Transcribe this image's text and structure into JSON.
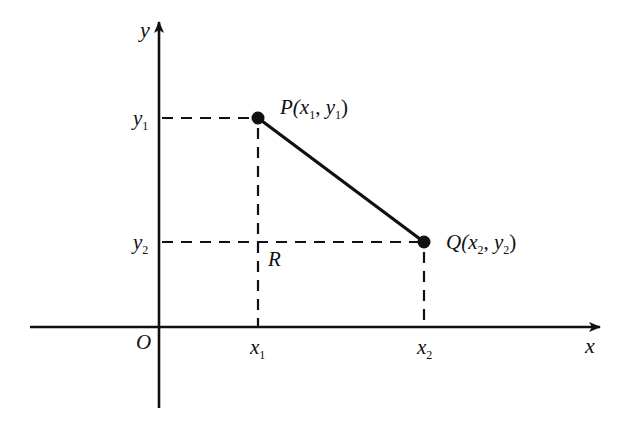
{
  "diagram": {
    "axes": {
      "x_label": "x",
      "y_label": "y",
      "origin_label": "O"
    },
    "points": {
      "P": {
        "name": "P",
        "label_open": "P(",
        "x_base": "x",
        "x_sub": "1",
        "sep": ", ",
        "y_base": "y",
        "y_sub": "1",
        "label_close": ")"
      },
      "Q": {
        "name": "Q",
        "label_open": "Q(",
        "x_base": "x",
        "x_sub": "2",
        "sep": ", ",
        "y_base": "y",
        "y_sub": "2",
        "label_close": ")"
      },
      "R": {
        "name": "R"
      }
    },
    "ticks": {
      "x1": {
        "base": "x",
        "sub": "1"
      },
      "x2": {
        "base": "x",
        "sub": "2"
      },
      "y1": {
        "base": "y",
        "sub": "1"
      },
      "y2": {
        "base": "y",
        "sub": "2"
      }
    },
    "colors": {
      "ink": "#111111",
      "background": "#ffffff"
    }
  }
}
